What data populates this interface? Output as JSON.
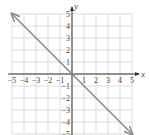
{
  "chart_data": {
    "type": "line",
    "title": "",
    "xlabel": "x",
    "ylabel": "y",
    "xlim": [
      -5,
      5
    ],
    "ylim": [
      -5,
      5
    ],
    "grid": true,
    "x_ticks": [
      -5,
      -4,
      -3,
      -2,
      -1,
      1,
      2,
      3,
      4,
      5
    ],
    "y_ticks": [
      5,
      4,
      3,
      2,
      1,
      -1,
      -2,
      -3,
      -4,
      -5
    ],
    "x_tick_labels": [
      "−5",
      "−4",
      "−3",
      "−2",
      "−1",
      "1",
      "2",
      "3",
      "4",
      "5"
    ],
    "y_tick_labels": [
      "5",
      "4",
      "3",
      "2",
      "1",
      "−1",
      "−2",
      "−3",
      "−4",
      "−5"
    ],
    "series": [
      {
        "name": "y = -x",
        "x": [
          -5,
          5
        ],
        "y": [
          5,
          -5
        ],
        "arrows": "both",
        "color": "#8a8a8a"
      }
    ]
  },
  "colors": {
    "grid": "#d4d4d4",
    "axis": "#333333",
    "line": "#8a8a8a",
    "text": "#444444"
  }
}
